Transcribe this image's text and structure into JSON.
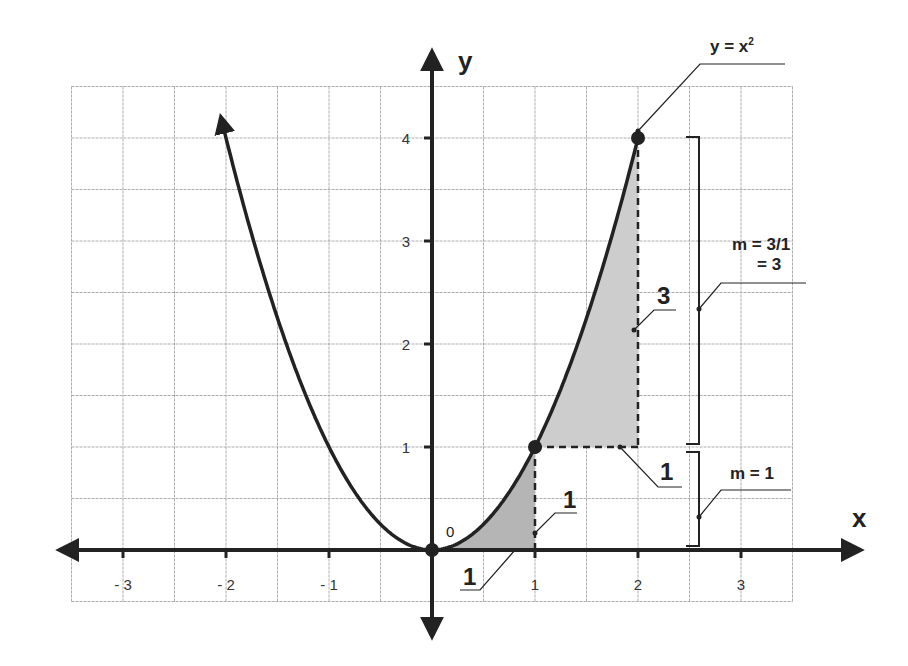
{
  "chart_data": {
    "type": "line",
    "title": "",
    "function": "y = x^2",
    "xlabel": "x",
    "ylabel": "y",
    "xlim": [
      -3.5,
      3.5
    ],
    "ylim": [
      -0.5,
      4.5
    ],
    "grid": true,
    "grid_step": 0.5,
    "x_ticks": [
      -3,
      -2,
      -1,
      1,
      2,
      3
    ],
    "x_tick_labels": [
      "- 3",
      "- 2",
      "- 1",
      "1",
      "2",
      "3"
    ],
    "y_ticks": [
      1,
      2,
      3,
      4
    ],
    "y_tick_labels": [
      "1",
      "2",
      "3",
      "4"
    ],
    "origin_label": "0",
    "curve_domain": [
      -2.05,
      2
    ],
    "points": [
      {
        "x": 0,
        "y": 0
      },
      {
        "x": 1,
        "y": 1
      },
      {
        "x": 2,
        "y": 4
      }
    ],
    "shaded_regions": [
      {
        "from_x": 0,
        "to_x": 1,
        "description": "area under curve between x=0 and x=1",
        "color": "#b8b8b8"
      },
      {
        "from_x": 1,
        "to_x": 2,
        "description": "area between curve and y=1 from x=1 to x=2",
        "color": "#d0d0d0"
      }
    ],
    "annotations": [
      {
        "text": "y = x²",
        "target": "curve at (2,4)"
      },
      {
        "text": "1",
        "target": "horizontal run from x=0 to x=1"
      },
      {
        "text": "1",
        "target": "vertical rise at x=1 (0 to 1)"
      },
      {
        "text": "1",
        "target": "horizontal run from x=1 to x=2"
      },
      {
        "text": "3",
        "target": "vertical rise at x=2 (1 to 4)"
      },
      {
        "text": "m = 3/1",
        "line2": "= 3",
        "target": "bracket y=1 to y=4"
      },
      {
        "text": "m = 1",
        "target": "bracket y=0 to y=1"
      }
    ]
  },
  "labels": {
    "x_axis": "x",
    "y_axis": "y",
    "origin": "0",
    "func": "y = x",
    "func_sup": "2",
    "run1": "1",
    "rise1": "1",
    "run2": "1",
    "rise2": "3",
    "slope_big_1": "m = 3/1",
    "slope_big_2": "= 3",
    "slope_small": "m = 1",
    "xt": [
      "- 3",
      "- 2",
      "- 1",
      "1",
      "2",
      "3"
    ],
    "yt": [
      "1",
      "2",
      "3",
      "4"
    ]
  },
  "colors": {
    "axis": "#222222",
    "grid": "#9a9a9a",
    "shade_dark": "#b5b5b5",
    "shade_light": "#cdcdcd"
  }
}
